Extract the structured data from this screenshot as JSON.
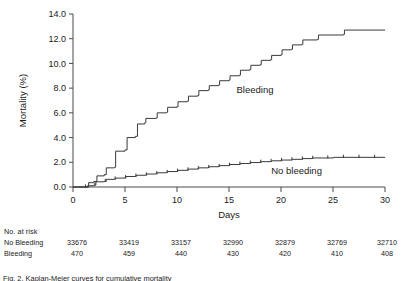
{
  "chart_data": {
    "type": "line",
    "title": "",
    "xlabel": "Days",
    "ylabel": "Mortality (%)",
    "xlim": [
      0,
      30
    ],
    "ylim": [
      0,
      14
    ],
    "xticks": [
      "0",
      "5",
      "10",
      "15",
      "20",
      "25",
      "30"
    ],
    "xtick_values": [
      0,
      5,
      10,
      15,
      20,
      25,
      30
    ],
    "yticks": [
      "0.0",
      "2.0",
      "4.0",
      "6.0",
      "8.0",
      "10.0",
      "12.0",
      "14.0"
    ],
    "ytick_values": [
      0,
      2,
      4,
      6,
      8,
      10,
      12,
      14
    ],
    "grid": false,
    "legend_position": "inline-annotation",
    "series": [
      {
        "name": "Bleeding",
        "label_x": 17.5,
        "label_y": 7.6,
        "step": true,
        "points": [
          [
            0,
            0.0
          ],
          [
            1,
            0.0
          ],
          [
            1.5,
            0.35
          ],
          [
            2,
            0.45
          ],
          [
            2.3,
            0.9
          ],
          [
            3,
            1.0
          ],
          [
            3.2,
            1.55
          ],
          [
            4,
            1.6
          ],
          [
            4.1,
            2.9
          ],
          [
            5,
            3.0
          ],
          [
            5.2,
            4.0
          ],
          [
            6,
            4.1
          ],
          [
            6.2,
            5.1
          ],
          [
            6.9,
            5.2
          ],
          [
            7.0,
            5.55
          ],
          [
            8,
            5.6
          ],
          [
            8.1,
            6.0
          ],
          [
            9,
            6.05
          ],
          [
            9.1,
            6.45
          ],
          [
            10,
            6.5
          ],
          [
            10.1,
            6.9
          ],
          [
            11,
            6.95
          ],
          [
            11.1,
            7.35
          ],
          [
            12,
            7.4
          ],
          [
            12.1,
            7.8
          ],
          [
            13,
            7.85
          ],
          [
            13.1,
            8.2
          ],
          [
            14,
            8.25
          ],
          [
            14.1,
            8.6
          ],
          [
            15,
            8.65
          ],
          [
            15.1,
            9.0
          ],
          [
            16,
            9.05
          ],
          [
            16.1,
            9.45
          ],
          [
            17,
            9.5
          ],
          [
            17.1,
            9.85
          ],
          [
            18,
            9.9
          ],
          [
            18.1,
            10.25
          ],
          [
            19,
            10.3
          ],
          [
            19.1,
            10.65
          ],
          [
            20,
            10.7
          ],
          [
            20.1,
            11.1
          ],
          [
            21,
            11.15
          ],
          [
            21.1,
            11.5
          ],
          [
            22,
            11.55
          ],
          [
            22.1,
            11.9
          ],
          [
            23.5,
            11.95
          ],
          [
            23.6,
            12.3
          ],
          [
            26,
            12.35
          ],
          [
            26.1,
            12.7
          ],
          [
            30,
            12.7
          ]
        ]
      },
      {
        "name": "No bleeding",
        "label_x": 21.5,
        "label_y": 1.05,
        "step": true,
        "points": [
          [
            0,
            0.0
          ],
          [
            1,
            0.0
          ],
          [
            1.4,
            0.1
          ],
          [
            2,
            0.15
          ],
          [
            2.2,
            0.42
          ],
          [
            3,
            0.45
          ],
          [
            3.2,
            0.62
          ],
          [
            4,
            0.65
          ],
          [
            4.1,
            0.72
          ],
          [
            5,
            0.75
          ],
          [
            5.1,
            0.85
          ],
          [
            6,
            0.88
          ],
          [
            6.1,
            0.95
          ],
          [
            7,
            0.98
          ],
          [
            7.1,
            1.05
          ],
          [
            8,
            1.08
          ],
          [
            8.1,
            1.15
          ],
          [
            9,
            1.18
          ],
          [
            9.1,
            1.25
          ],
          [
            10,
            1.28
          ],
          [
            10.1,
            1.35
          ],
          [
            11,
            1.38
          ],
          [
            11.1,
            1.45
          ],
          [
            12,
            1.48
          ],
          [
            12.1,
            1.55
          ],
          [
            13,
            1.58
          ],
          [
            13.1,
            1.64
          ],
          [
            14,
            1.67
          ],
          [
            14.1,
            1.73
          ],
          [
            15,
            1.76
          ],
          [
            15.1,
            1.82
          ],
          [
            16,
            1.85
          ],
          [
            16.1,
            1.9
          ],
          [
            17,
            1.93
          ],
          [
            17.1,
            1.98
          ],
          [
            18,
            2.0
          ],
          [
            18.1,
            2.05
          ],
          [
            19,
            2.07
          ],
          [
            19.1,
            2.12
          ],
          [
            20,
            2.14
          ],
          [
            20.1,
            2.18
          ],
          [
            21,
            2.2
          ],
          [
            21.1,
            2.24
          ],
          [
            22,
            2.26
          ],
          [
            22.1,
            2.3
          ],
          [
            23,
            2.32
          ],
          [
            23.1,
            2.35
          ],
          [
            25,
            2.37
          ],
          [
            25.1,
            2.4
          ],
          [
            30,
            2.42
          ]
        ],
        "censor_marks": [
          1.2,
          2.1,
          3.1,
          4.05,
          5.05,
          6.05,
          7.05,
          8.05,
          9.05,
          10.05,
          11.05,
          12.05,
          13.05,
          14.05,
          15.05,
          16.05,
          17.05,
          18.05,
          19.05,
          20.05,
          21.05,
          22.05,
          23.05,
          24.5,
          26,
          27.5,
          29
        ]
      }
    ]
  },
  "risk_table": {
    "heading": "No. at risk",
    "columns_x": [
      0,
      5,
      10,
      15,
      20,
      25,
      30
    ],
    "rows": [
      {
        "label": "No Bleeding",
        "values": [
          "33676",
          "33419",
          "33157",
          "32990",
          "32879",
          "32769",
          "32710"
        ]
      },
      {
        "label": "Bleeding",
        "values": [
          "470",
          "459",
          "440",
          "430",
          "420",
          "410",
          "408"
        ]
      }
    ]
  },
  "caption": {
    "text": "Fig. 2. Kaplan-Meier curves for cumulative mortality"
  },
  "colors": {
    "axis": "#4a4a4a",
    "curve": "#3a3a3a",
    "text": "#1a1a1a",
    "background": "#ffffff"
  }
}
